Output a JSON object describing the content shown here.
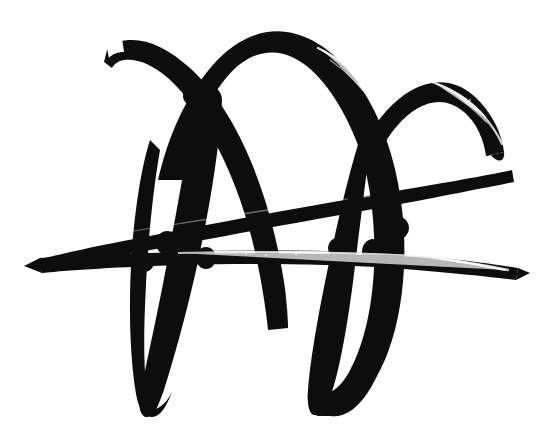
{
  "artwork": {
    "title": "",
    "medium": "brush-and-ink calligraphic mark",
    "subject": "abstract looping signature flourish",
    "background_color": "#ffffff",
    "ink_color": "#0d0d0d",
    "canvas": {
      "width": 548,
      "height": 440
    },
    "stroke_count": 4,
    "strokes": [
      {
        "name": "left-rising-arc",
        "description": "Stroke begins at upper left with a blunt chisel-cut tip, swells, then sweeps down and right into the first descending loop wall.",
        "start_point": [
          108,
          46
        ],
        "end_point": [
          196,
          300
        ],
        "max_width_px": 26,
        "tip_style": "flat-chisel"
      },
      {
        "name": "central-dome-arc",
        "description": "Tall rounded dome arching over the centre of the composition, thinning and drying on its right shoulder.",
        "apex_point": [
          268,
          33
        ],
        "left_foot": [
          150,
          300
        ],
        "right_foot": [
          392,
          300
        ],
        "max_width_px": 30,
        "texture": "dry-brush speckle on right shoulder"
      },
      {
        "name": "right-dome-arc",
        "description": "Smaller dome at the right, cresting lower than the centre arc and terminating in a hooked tail at the far right.",
        "apex_point": [
          440,
          84
        ],
        "left_foot": [
          366,
          215
        ],
        "tail_point": [
          503,
          150
        ],
        "max_width_px": 22,
        "texture": "dry-brush speckle along upper edge"
      },
      {
        "name": "long-diagonal-sweep",
        "description": "Two nearly parallel near-horizontal strokes crossing the whole width, rising gently to the right, pointed at both ends.",
        "left_tip": [
          36,
          262
        ],
        "right_tip": [
          522,
          271
        ],
        "max_width_px": 16,
        "texture": "split-brush white streak through the centre"
      }
    ],
    "loops": [
      {
        "name": "left-descending-loop",
        "bottom_point": [
          146,
          416
        ],
        "bottom_shape": "pointed-v"
      },
      {
        "name": "right-descending-loop",
        "bottom_point": [
          312,
          414
        ],
        "bottom_shape": "pointed-v"
      }
    ],
    "crossings": [
      {
        "name": "upper-left-x-crossing",
        "point": [
          196,
          96
        ]
      },
      {
        "name": "right-arc-junction",
        "point": [
          372,
          130
        ]
      },
      {
        "name": "upper-sweep-left-loop-crossing",
        "point": [
          168,
          235
        ]
      },
      {
        "name": "lower-sweep-right-loop-crossing",
        "point": [
          372,
          250
        ]
      }
    ]
  }
}
